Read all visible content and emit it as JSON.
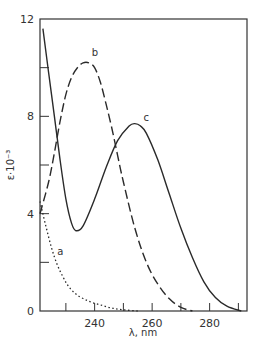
{
  "chart_data": {
    "type": "line",
    "title": "",
    "xlabel": "λ, nm",
    "ylabel": "ε·10⁻³",
    "xlim": [
      221,
      293
    ],
    "ylim": [
      0,
      12
    ],
    "grid": false,
    "legend": "none (curves labeled inline a, b, c)",
    "x_ticks": [
      240,
      260,
      280
    ],
    "x_minor_ticks": [
      230,
      250,
      270,
      290
    ],
    "y_ticks": [
      0,
      4,
      8,
      12
    ],
    "y_minor_ticks": [
      2,
      6,
      10
    ],
    "x_tick_labels": [
      "240",
      "260",
      "280"
    ],
    "y_tick_labels": [
      "0",
      "4",
      "8",
      "12"
    ],
    "series": [
      {
        "name": "a",
        "style": "dotted",
        "x": [
          221,
          223,
          225,
          227,
          229,
          231,
          234,
          238,
          242,
          246,
          250,
          255
        ],
        "y": [
          4.5,
          3.5,
          2.6,
          1.9,
          1.4,
          1.0,
          0.65,
          0.4,
          0.25,
          0.12,
          0.05,
          0.0
        ]
      },
      {
        "name": "b",
        "style": "dashed",
        "x": [
          221,
          224,
          226,
          228,
          230,
          232,
          234,
          236,
          238,
          240,
          242,
          244,
          246,
          248,
          250,
          254,
          258,
          262,
          266,
          270,
          274
        ],
        "y": [
          4.0,
          5.3,
          6.5,
          7.8,
          8.9,
          9.6,
          10.0,
          10.2,
          10.2,
          10.0,
          9.4,
          8.5,
          7.5,
          6.4,
          5.3,
          3.4,
          2.0,
          1.1,
          0.5,
          0.15,
          0.0
        ]
      },
      {
        "name": "c",
        "style": "solid",
        "x": [
          222,
          224,
          226,
          228,
          230,
          232,
          233.5,
          236,
          240,
          244,
          248,
          252,
          254,
          256,
          258,
          262,
          266,
          270,
          274,
          278,
          282,
          286,
          291
        ],
        "y": [
          11.6,
          9.8,
          8.0,
          6.2,
          4.6,
          3.6,
          3.3,
          3.5,
          4.6,
          5.9,
          7.0,
          7.6,
          7.7,
          7.6,
          7.3,
          6.2,
          4.8,
          3.4,
          2.2,
          1.2,
          0.55,
          0.2,
          0.0
        ]
      }
    ],
    "annotations": [
      {
        "text": "a",
        "x": 227,
        "y": 2.3
      },
      {
        "text": "b",
        "x": 239,
        "y": 10.5
      },
      {
        "text": "c",
        "x": 257,
        "y": 7.8
      }
    ]
  },
  "axes": {
    "xlabel": "λ, nm",
    "ylabel": "ε·10⁻³",
    "x_tick_labels": [
      "240",
      "260",
      "280"
    ],
    "y_tick_labels": [
      "0",
      "4",
      "8",
      "12"
    ]
  },
  "labels": {
    "a": "a",
    "b": "b",
    "c": "c"
  }
}
